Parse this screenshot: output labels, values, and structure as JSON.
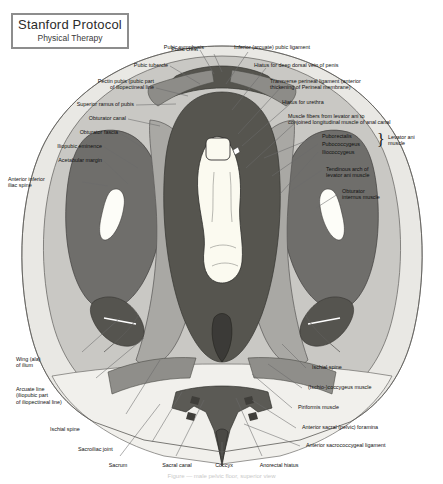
{
  "title": {
    "main": "Stanford Protocol",
    "sub": "Physical Therapy"
  },
  "figure": {
    "caption": "Figure — male pelvic floor, superior view"
  },
  "labels": {
    "pubic_symphysis": "Pubic symphysis",
    "inferior_arcuate_pubic_ligament": "Inferior (arcuate) pubic ligament",
    "hiatus_deep_dorsal_vein": "Hiatus for deep dorsal vein of penis",
    "transverse_perineal_ligament": "Transverse perineal ligament (anterior\nthickening of Perineal membrane)",
    "hiatus_urethra": "Hiatus for urethra",
    "muscle_fibers_levator": "Muscle fibers from levator ani to\nconjoined longitudinal muscle of anal canal",
    "puborectalis": "Puborectalis",
    "pubococcygeus": "Pubococcygeus",
    "iliococcygeus": "Iliococcygeus",
    "levator_ani_muscle": "Levator ani\nmuscle",
    "tendinous_arch": "Tendinous arch of\nlevator ani muscle",
    "obturator_internus": "Obturator\ninternus muscle",
    "pubic_crest": "Pubic crest",
    "pubic_tubercle": "Pubic tubercle",
    "pectin_pubis": "Pectin pubis (pubic part\nof iliopectineal line",
    "superior_ramus_pubis": "Superior ramus of pubis",
    "obturator_canal": "Obturator canal",
    "obturator_fascia": "Obturator fascia",
    "iliopubic_eminence": "Iliopubic eminence",
    "acetabular_margin": "Acetabular margin",
    "anterior_inferior_iliac_spine": "Anterior inferior\niliac spine",
    "wing_ala_ilium": "Wing (ala)\nof ilium",
    "arcuate_line": "Arcuate line\n(iliopubic part\nof iliopectineal line)",
    "ischial_spine_left": "Ischial spine",
    "sacroiliac_joint": "Sacroiliac joint",
    "sacrum": "Sacrum",
    "sacral_canal": "Sacral canal",
    "coccyx": "Coccyx",
    "anorectal_hiatus": "Anorectal hiatus",
    "anterior_sacrococcygeal_ligament": "Anterior sacrococcygeal ligament",
    "anterior_sacral_foramina": "Anterior sacral (pelvic) foramina",
    "piriformis_muscle": "Piriformis muscle",
    "ischio_coccygeus_muscle": "(Ischio-)coccygeus muscle",
    "ischial_spine_right": "Ischial spine"
  },
  "colors": {
    "border": "#8d8d8d",
    "text": "#111111",
    "background": "#ffffff",
    "tone_lightest": "#f2f1ee",
    "tone_light": "#d5d4d0",
    "tone_mid": "#b0afab",
    "tone_mid_dark": "#908f8b",
    "tone_dark": "#6e6d6a",
    "tone_darkest": "#4c4b49",
    "leader": "#6b6b6b",
    "highlight": "#fcfbf4"
  }
}
